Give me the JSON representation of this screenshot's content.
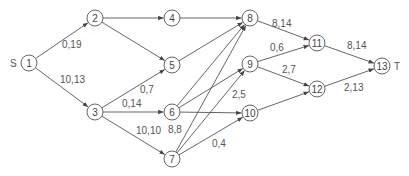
{
  "diagram": {
    "type": "directed network",
    "source_label": "S",
    "sink_label": "T",
    "colors": {
      "stroke": "#555555",
      "text": "#444444",
      "background": "#ffffff"
    },
    "nodes": [
      {
        "id": "1",
        "x": 29,
        "y": 63
      },
      {
        "id": "2",
        "x": 95,
        "y": 18
      },
      {
        "id": "3",
        "x": 95,
        "y": 112
      },
      {
        "id": "4",
        "x": 172,
        "y": 18
      },
      {
        "id": "5",
        "x": 172,
        "y": 65
      },
      {
        "id": "6",
        "x": 172,
        "y": 112
      },
      {
        "id": "7",
        "x": 172,
        "y": 159
      },
      {
        "id": "8",
        "x": 250,
        "y": 18
      },
      {
        "id": "9",
        "x": 250,
        "y": 64
      },
      {
        "id": "10",
        "x": 250,
        "y": 113
      },
      {
        "id": "11",
        "x": 317,
        "y": 43
      },
      {
        "id": "12",
        "x": 317,
        "y": 89
      },
      {
        "id": "13",
        "x": 382,
        "y": 66
      }
    ],
    "edges": [
      {
        "from": "1",
        "to": "2",
        "label": "0,19",
        "lx": 62,
        "ly": 48
      },
      {
        "from": "1",
        "to": "3",
        "label": "10,13",
        "lx": 60,
        "ly": 83
      },
      {
        "from": "2",
        "to": "4",
        "label": ""
      },
      {
        "from": "2",
        "to": "5",
        "label": ""
      },
      {
        "from": "3",
        "to": "5",
        "label": "0,7",
        "lx": 140,
        "ly": 93
      },
      {
        "from": "3",
        "to": "6",
        "label": "0,14",
        "lx": 122,
        "ly": 107
      },
      {
        "from": "3",
        "to": "7",
        "label": "10,10",
        "lx": 136,
        "ly": 134
      },
      {
        "from": "4",
        "to": "8",
        "label": ""
      },
      {
        "from": "5",
        "to": "8",
        "label": ""
      },
      {
        "from": "6",
        "to": "8",
        "label": ""
      },
      {
        "from": "6",
        "to": "9",
        "label": ""
      },
      {
        "from": "6",
        "to": "10",
        "label": ""
      },
      {
        "from": "7",
        "to": "8",
        "label": "8,8",
        "lx": 168,
        "ly": 133
      },
      {
        "from": "7",
        "to": "9",
        "label": "2,5",
        "lx": 232,
        "ly": 98
      },
      {
        "from": "7",
        "to": "10",
        "label": "0,4",
        "lx": 212,
        "ly": 147
      },
      {
        "from": "8",
        "to": "11",
        "label": "8,14",
        "lx": 272,
        "ly": 27
      },
      {
        "from": "9",
        "to": "11",
        "label": "0,6",
        "lx": 270,
        "ly": 51
      },
      {
        "from": "9",
        "to": "12",
        "label": "2,7",
        "lx": 282,
        "ly": 73
      },
      {
        "from": "10",
        "to": "12",
        "label": ""
      },
      {
        "from": "11",
        "to": "13",
        "label": "8,14",
        "lx": 347,
        "ly": 49
      },
      {
        "from": "12",
        "to": "13",
        "label": "2,13",
        "lx": 344,
        "ly": 91
      }
    ]
  }
}
